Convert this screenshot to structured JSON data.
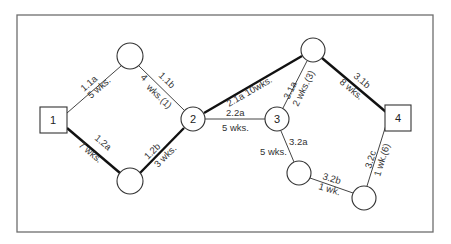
{
  "diagram": {
    "type": "activity-network",
    "nodes": [
      {
        "id": "n1",
        "label": "1",
        "shape": "square",
        "x": 53,
        "y": 120
      },
      {
        "id": "a",
        "label": "",
        "shape": "circle",
        "x": 130,
        "y": 56
      },
      {
        "id": "b",
        "label": "",
        "shape": "circle",
        "x": 130,
        "y": 181
      },
      {
        "id": "n2",
        "label": "2",
        "shape": "circle",
        "x": 193,
        "y": 119
      },
      {
        "id": "n3",
        "label": "3",
        "shape": "circle",
        "x": 277,
        "y": 119
      },
      {
        "id": "c",
        "label": "",
        "shape": "circle",
        "x": 313,
        "y": 50
      },
      {
        "id": "d",
        "label": "",
        "shape": "circle",
        "x": 299,
        "y": 173
      },
      {
        "id": "e",
        "label": "",
        "shape": "circle",
        "x": 364,
        "y": 198
      },
      {
        "id": "n4",
        "label": "4",
        "shape": "square",
        "x": 398,
        "y": 118
      }
    ],
    "edges": [
      {
        "from": "n1",
        "to": "a",
        "activity": "1.1a",
        "duration": "5 wks.",
        "critical": false
      },
      {
        "from": "a",
        "to": "n2",
        "activity": "1.1b",
        "duration": "4 wks.(1)",
        "critical": false
      },
      {
        "from": "n1",
        "to": "b",
        "activity": "1.2a",
        "duration": "7 wks.",
        "critical": true
      },
      {
        "from": "b",
        "to": "n2",
        "activity": "1.2b",
        "duration": "3 wks.",
        "critical": true
      },
      {
        "from": "n2",
        "to": "c",
        "activity": "2.1a",
        "duration": "10wks.",
        "critical": true
      },
      {
        "from": "n2",
        "to": "n3",
        "activity": "2.2a",
        "duration": "5 wks.",
        "critical": false
      },
      {
        "from": "n3",
        "to": "c",
        "activity": "3.1a",
        "duration": "2 wks.(3)",
        "critical": false
      },
      {
        "from": "c",
        "to": "n4",
        "activity": "3.1b",
        "duration": "8 wks.",
        "critical": true
      },
      {
        "from": "n3",
        "to": "d",
        "activity": "3.2a",
        "duration": "5 wks.",
        "critical": false
      },
      {
        "from": "d",
        "to": "e",
        "activity": "3.2b",
        "duration": "1 wk.",
        "critical": false
      },
      {
        "from": "e",
        "to": "n4",
        "activity": "3.2c",
        "duration": "1 wk.(6)",
        "critical": false
      }
    ],
    "labels": {
      "e_1_1a": "1.1a",
      "e_1_1a_d": "5 wks.",
      "e_1_1b": "1.1b",
      "e_1_1b_d": "4 wks.(1)",
      "e_1_2a": "1.2a",
      "e_1_2a_d": "7 wks.",
      "e_1_2b": "1.2b",
      "e_1_2b_d": "3 wks.",
      "e_2_1a": "2.1a 10wks.",
      "e_2_2a": "2.2a",
      "e_2_2a_d": "5 wks.",
      "e_3_1a": "3.1a",
      "e_3_1a_d": "2 wks.(3)",
      "e_3_1b": "3.1b",
      "e_3_1b_d": "8 wks.",
      "e_3_2a": "3.2a",
      "e_3_2a_d": "5 wks.",
      "e_3_2b": "3.2b",
      "e_3_2b_d": "1 wk.",
      "e_3_2c": "3.2c",
      "e_3_2c_d": "1 wk.(6)",
      "n1": "1",
      "n2": "2",
      "n3": "3",
      "n4": "4"
    },
    "colors": {
      "line": "#111111",
      "thin_line": "#444444",
      "frame": "#6e6e6e",
      "background": "#ffffff"
    }
  }
}
